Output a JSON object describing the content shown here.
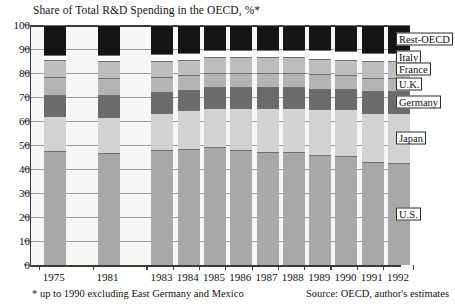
{
  "chart_data": {
    "type": "bar",
    "title": "Share of Total R&D Spending in the OECD, %*",
    "xlabel": "",
    "ylabel": "",
    "ylim": [
      0,
      100
    ],
    "yticks": [
      0,
      10,
      20,
      30,
      40,
      50,
      60,
      70,
      80,
      90,
      100
    ],
    "grid": true,
    "stacked": true,
    "legend_position": "right-inline",
    "categories": [
      "1975",
      "1981",
      "1983",
      "1984",
      "1985",
      "1986",
      "1987",
      "1988",
      "1989",
      "1990",
      "1991",
      "1992"
    ],
    "series": [
      {
        "name": "U.S.",
        "color": "#a8a8a8",
        "values": [
          47.5,
          46.5,
          48.0,
          48.5,
          49.0,
          48.0,
          47.0,
          47.0,
          46.0,
          45.5,
          43.0,
          42.5
        ]
      },
      {
        "name": "Japan",
        "color": "#d2d2d2",
        "values": [
          14.5,
          15.0,
          15.5,
          16.0,
          16.5,
          17.5,
          18.5,
          18.5,
          19.0,
          19.5,
          20.5,
          21.0
        ]
      },
      {
        "name": "Germany",
        "color": "#6b6b6b",
        "values": [
          9.0,
          9.5,
          8.5,
          8.5,
          8.5,
          8.5,
          8.5,
          8.5,
          8.5,
          8.5,
          9.0,
          9.0
        ]
      },
      {
        "name": "U.K.",
        "color": "#b4b4b4",
        "values": [
          7.5,
          7.0,
          6.5,
          6.0,
          6.0,
          6.0,
          6.0,
          6.0,
          6.0,
          5.5,
          5.5,
          5.5
        ]
      },
      {
        "name": "France",
        "color": "#bdbdbd",
        "values": [
          7.0,
          7.0,
          6.5,
          6.5,
          6.5,
          6.5,
          6.5,
          6.5,
          6.5,
          6.5,
          7.0,
          7.0
        ]
      },
      {
        "name": "Italy",
        "color": "#ffffff",
        "values": [
          2.0,
          2.5,
          3.0,
          3.0,
          3.0,
          3.0,
          3.0,
          3.0,
          3.5,
          3.5,
          3.5,
          3.5
        ]
      },
      {
        "name": "Rest-OECD",
        "color": "#151515",
        "values": [
          12.5,
          12.5,
          12.0,
          11.5,
          10.5,
          10.5,
          10.5,
          10.5,
          10.5,
          11.0,
          11.5,
          11.5
        ]
      }
    ],
    "annotations": {
      "footnote": "* up to 1990 excluding East Germany and Mexico",
      "source": "Source: OECD, author's estimates"
    }
  },
  "legend": {
    "items": [
      {
        "label": "Rest-OECD"
      },
      {
        "label": "Italy"
      },
      {
        "label": "France"
      },
      {
        "label": "U.K."
      },
      {
        "label": "Germany"
      },
      {
        "label": "Japan"
      },
      {
        "label": "U.S."
      }
    ]
  }
}
